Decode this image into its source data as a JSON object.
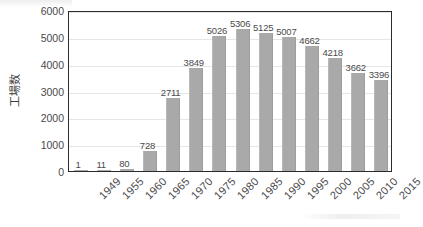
{
  "chart_data": {
    "type": "bar",
    "title": "",
    "subtitle": "",
    "xlabel": "",
    "ylabel": "工場数",
    "categories": [
      "1949",
      "1955",
      "1960",
      "1965",
      "1970",
      "1975",
      "1980",
      "1985",
      "1990",
      "1995",
      "2000",
      "2005",
      "2010",
      "2015"
    ],
    "values": [
      1,
      11,
      80,
      728,
      2711,
      3849,
      5026,
      5306,
      5125,
      5007,
      4662,
      4218,
      3662,
      3396
    ],
    "value_labels": [
      "1",
      "11",
      "80",
      "728",
      "2711",
      "3849",
      "5026",
      "5306",
      "5125",
      "5007",
      "4662",
      "4218",
      "3662",
      "3396"
    ],
    "ylim": [
      0,
      6000
    ],
    "ytick_step": 1000,
    "ytick_labels": [
      "0",
      "1000",
      "2000",
      "3000",
      "4000",
      "5000",
      "6000"
    ],
    "grid": true,
    "grid_axis": "y",
    "legend": false,
    "legend_position": "none",
    "bar_color": "#a9a9a9",
    "grid_color": "#e6e6e6",
    "frame_color": "#2b2b2b",
    "text_color": "#4a4a4a",
    "background_color": "#ffffff",
    "data_labels_shown": true,
    "xtick_rotation": -45
  }
}
